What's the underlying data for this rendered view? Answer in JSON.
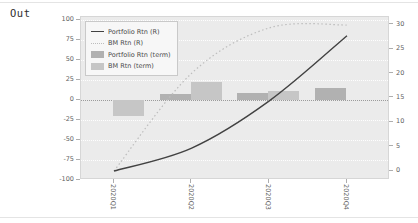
{
  "out_label": "Out",
  "chart_data": {
    "type": "combo",
    "title": "",
    "categories": [
      "2020Q1",
      "2020Q2",
      "2020Q3",
      "2020Q4"
    ],
    "series": [
      {
        "name": "Portfolio Rtn (R)",
        "type": "line",
        "axis": "right",
        "style": "solid",
        "color": "#424242",
        "values": [
          0,
          4.7,
          14.4,
          27.8
        ]
      },
      {
        "name": "BM Rtn (R)",
        "type": "line",
        "axis": "right",
        "style": "dotted",
        "color": "#bdbdbd",
        "values": [
          0,
          20.1,
          29.4,
          30.0
        ]
      },
      {
        "name": "Portfolio Rtn (term)",
        "type": "bar",
        "axis": "left",
        "style": "fill",
        "color": "#b1b1b1",
        "values": [
          0,
          8,
          9,
          15
        ]
      },
      {
        "name": "BM Rtn (term)",
        "type": "bar",
        "axis": "left",
        "style": "fill",
        "color": "#c6c6c6",
        "values": [
          -20,
          22,
          11,
          0
        ]
      }
    ],
    "left_axis": {
      "ticks": [
        100,
        75,
        50,
        25,
        0,
        -25,
        -50,
        -75,
        -100
      ],
      "range": [
        -100,
        100
      ]
    },
    "right_axis": {
      "ticks": [
        30,
        25,
        20,
        15,
        10,
        5,
        0
      ],
      "range": [
        -1.8,
        31.5
      ]
    },
    "legend_position": "upper-left",
    "grid": "horizontal dotted"
  }
}
